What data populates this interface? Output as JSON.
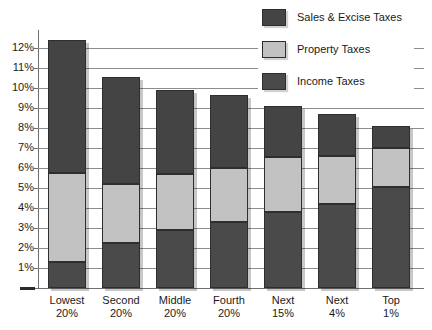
{
  "chart_data": {
    "type": "bar",
    "stacked": true,
    "title": "",
    "subtitle": "",
    "xlabel": "",
    "ylabel": "",
    "ylim": [
      0,
      12.6
    ],
    "grid": true,
    "legend_position": "top-right",
    "categories": [
      {
        "line1": "Lowest",
        "line2": "20%"
      },
      {
        "line1": "Second",
        "line2": "20%"
      },
      {
        "line1": "Middle",
        "line2": "20%"
      },
      {
        "line1": "Fourth",
        "line2": "20%"
      },
      {
        "line1": "Next",
        "line2": "15%"
      },
      {
        "line1": "Next",
        "line2": "4%"
      },
      {
        "line1": "Top",
        "line2": "1%"
      }
    ],
    "ytick_labels": [
      "12%",
      "11%",
      "10%",
      "9%",
      "8%",
      "7%",
      "6%",
      "5%",
      "4%",
      "3%",
      "2%",
      "1%"
    ],
    "ytick_values": [
      12,
      11,
      10,
      9,
      8,
      7,
      6,
      5,
      4,
      3,
      2,
      1
    ],
    "series": [
      {
        "name": "Income Taxes",
        "color": "#4a4a4a",
        "values": [
          1.3,
          2.25,
          2.9,
          3.3,
          3.8,
          4.2,
          5.05
        ]
      },
      {
        "name": "Property Taxes",
        "color": "#c2c2c2",
        "values": [
          4.45,
          2.95,
          2.8,
          2.7,
          2.75,
          2.4,
          1.95
        ]
      },
      {
        "name": "Sales & Excise Taxes",
        "color": "#444444",
        "values": [
          6.65,
          5.35,
          4.2,
          3.65,
          2.55,
          2.1,
          1.1
        ]
      }
    ],
    "totals": [
      12.4,
      10.55,
      9.9,
      9.65,
      9.1,
      8.7,
      8.1
    ]
  },
  "legend": {
    "items": [
      {
        "label": "Sales & Excise Taxes",
        "swatch": "sw-sales"
      },
      {
        "label": "Property Taxes",
        "swatch": "sw-property"
      },
      {
        "label": "Income Taxes",
        "swatch": "sw-income"
      }
    ]
  }
}
